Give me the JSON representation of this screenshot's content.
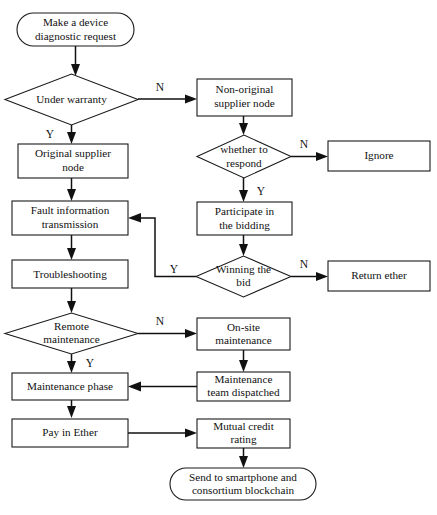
{
  "diagram": {
    "type": "flowchart",
    "nodes": [
      {
        "id": "start",
        "shape": "terminal",
        "lines": [
          "Make a device",
          "diagnostic request"
        ]
      },
      {
        "id": "under_warranty",
        "shape": "decision",
        "lines": [
          "Under warranty"
        ]
      },
      {
        "id": "original_node",
        "shape": "process",
        "lines": [
          "Original supplier",
          "node"
        ]
      },
      {
        "id": "fault_info",
        "shape": "process",
        "lines": [
          "Fault information",
          "transmission"
        ]
      },
      {
        "id": "troubleshooting",
        "shape": "process",
        "lines": [
          "Troubleshooting"
        ]
      },
      {
        "id": "remote_maint",
        "shape": "decision",
        "lines": [
          "Remote",
          "maintenance"
        ]
      },
      {
        "id": "maint_phase",
        "shape": "process",
        "lines": [
          "Maintenance phase"
        ]
      },
      {
        "id": "pay_ether",
        "shape": "process",
        "lines": [
          "Pay in Ether"
        ]
      },
      {
        "id": "non_original",
        "shape": "process",
        "lines": [
          "Non-original",
          "supplier node"
        ]
      },
      {
        "id": "whether_respond",
        "shape": "decision",
        "lines": [
          "whether to",
          "respond"
        ]
      },
      {
        "id": "participate",
        "shape": "process",
        "lines": [
          "Participate in",
          "the bidding"
        ]
      },
      {
        "id": "winning_bid",
        "shape": "decision",
        "lines": [
          "Winning the",
          "bid"
        ]
      },
      {
        "id": "onsite_maint",
        "shape": "process",
        "lines": [
          "On-site",
          "maintenance"
        ]
      },
      {
        "id": "team_dispatched",
        "shape": "process",
        "lines": [
          "Maintenance",
          "team dispatched"
        ]
      },
      {
        "id": "mutual_credit",
        "shape": "process",
        "lines": [
          "Mutual credit",
          "rating"
        ]
      },
      {
        "id": "ignore",
        "shape": "process",
        "lines": [
          "Ignore"
        ]
      },
      {
        "id": "return_ether",
        "shape": "process",
        "lines": [
          "Return ether"
        ]
      },
      {
        "id": "send_phone",
        "shape": "terminal",
        "lines": [
          "Send to smartphone and",
          "consortium blockchain"
        ]
      }
    ],
    "edges": [
      {
        "from": "start",
        "to": "under_warranty",
        "label": ""
      },
      {
        "from": "under_warranty",
        "to": "non_original",
        "label": "N"
      },
      {
        "from": "under_warranty",
        "to": "original_node",
        "label": "Y"
      },
      {
        "from": "original_node",
        "to": "fault_info",
        "label": ""
      },
      {
        "from": "fault_info",
        "to": "troubleshooting",
        "label": ""
      },
      {
        "from": "troubleshooting",
        "to": "remote_maint",
        "label": ""
      },
      {
        "from": "remote_maint",
        "to": "onsite_maint",
        "label": "N"
      },
      {
        "from": "remote_maint",
        "to": "maint_phase",
        "label": "Y"
      },
      {
        "from": "maint_phase",
        "to": "pay_ether",
        "label": ""
      },
      {
        "from": "pay_ether",
        "to": "mutual_credit",
        "label": ""
      },
      {
        "from": "non_original",
        "to": "whether_respond",
        "label": ""
      },
      {
        "from": "whether_respond",
        "to": "ignore",
        "label": "N"
      },
      {
        "from": "whether_respond",
        "to": "participate",
        "label": "Y"
      },
      {
        "from": "participate",
        "to": "winning_bid",
        "label": ""
      },
      {
        "from": "winning_bid",
        "to": "return_ether",
        "label": "N"
      },
      {
        "from": "winning_bid",
        "to": "fault_info",
        "label": "Y"
      },
      {
        "from": "onsite_maint",
        "to": "team_dispatched",
        "label": ""
      },
      {
        "from": "team_dispatched",
        "to": "maint_phase",
        "label": ""
      },
      {
        "from": "mutual_credit",
        "to": "send_phone",
        "label": ""
      }
    ],
    "edge_labels": {
      "warranty_no": "N",
      "warranty_yes": "Y",
      "respond_no": "N",
      "respond_yes": "Y",
      "bid_no": "N",
      "bid_yes": "Y",
      "remote_no": "N",
      "remote_yes": "Y"
    },
    "colors": {
      "stroke": "#111111",
      "fill": "#ffffff",
      "text": "#111111",
      "background": "#ffffff"
    }
  },
  "labels": {
    "start_l1": "Make a device",
    "start_l2": "diagnostic request",
    "under_warranty": "Under warranty",
    "original_node_l1": "Original supplier",
    "original_node_l2": "node",
    "fault_info_l1": "Fault information",
    "fault_info_l2": "transmission",
    "troubleshooting": "Troubleshooting",
    "remote_maint_l1": "Remote",
    "remote_maint_l2": "maintenance",
    "maint_phase": "Maintenance phase",
    "pay_ether": "Pay in Ether",
    "non_original_l1": "Non-original",
    "non_original_l2": "supplier node",
    "whether_respond_l1": "whether to",
    "whether_respond_l2": "respond",
    "participate_l1": "Participate in",
    "participate_l2": "the bidding",
    "winning_bid_l1": "Winning the",
    "winning_bid_l2": "bid",
    "onsite_maint_l1": "On-site",
    "onsite_maint_l2": "maintenance",
    "team_dispatched_l1": "Maintenance",
    "team_dispatched_l2": "team dispatched",
    "mutual_credit_l1": "Mutual credit",
    "mutual_credit_l2": "rating",
    "ignore": "Ignore",
    "return_ether": "Return ether",
    "send_phone_l1": "Send to smartphone and",
    "send_phone_l2": "consortium blockchain"
  }
}
